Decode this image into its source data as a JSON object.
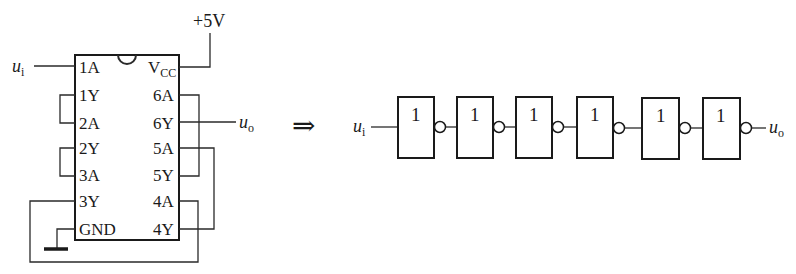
{
  "chip": {
    "supply_label": "+5V",
    "notch": true,
    "left_pins": [
      "1A",
      "1Y",
      "2A",
      "2Y",
      "3A",
      "3Y",
      "GND"
    ],
    "right_pins": [
      "V",
      "6A",
      "6Y",
      "5A",
      "5Y",
      "4A",
      "4Y"
    ],
    "vcc_subscript": "CC",
    "input_label": "u",
    "input_sub": "i",
    "output_label": "u",
    "output_sub": "o"
  },
  "arrow": "⇒",
  "chain": {
    "input_label": "u",
    "input_sub": "i",
    "output_label": "u",
    "output_sub": "o",
    "gates": [
      {
        "symbol": "1"
      },
      {
        "symbol": "1"
      },
      {
        "symbol": "1"
      },
      {
        "symbol": "1"
      },
      {
        "symbol": "1"
      },
      {
        "symbol": "1"
      }
    ]
  },
  "colors": {
    "line": "#2a2a2a",
    "background": "#ffffff"
  }
}
